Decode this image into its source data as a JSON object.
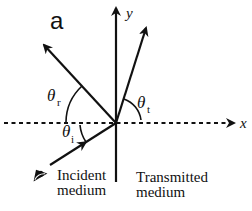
{
  "figure": {
    "panel_label": "a",
    "axes": {
      "x_label": "x",
      "y_label": "y"
    },
    "angles": {
      "incident": {
        "symbol": "θ",
        "subscript": "i"
      },
      "reflected": {
        "symbol": "θ",
        "subscript": "r"
      },
      "transmitted": {
        "symbol": "θ",
        "subscript": "t"
      }
    },
    "media": {
      "incident": {
        "line1": "Incident",
        "line2": "medium"
      },
      "transmitted": {
        "line1": "Transmitted",
        "line2": "medium"
      }
    },
    "rays": [
      "incident",
      "reflected",
      "transmitted"
    ],
    "icons": [
      "eye-icon"
    ],
    "colors": {
      "stroke": "#111111",
      "background": "#ffffff"
    }
  }
}
